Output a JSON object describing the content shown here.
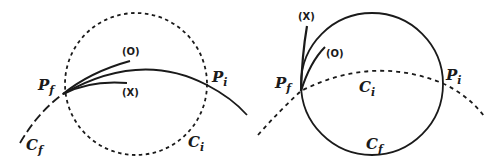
{
  "diagram": {
    "panels": [
      {
        "id": "left",
        "labels": {
          "pf": "P",
          "pf_sub": "f",
          "pi": "P",
          "pi_sub": "i",
          "cf": "C",
          "cf_sub": "f",
          "ci": "C",
          "ci_sub": "i",
          "tag_o": "(O)",
          "tag_x": "(X)"
        },
        "description": "Dashed circle C_i; solid arc C_f through P_f and P_i with two short tangent curves (O) and (X) at P_f"
      },
      {
        "id": "right",
        "labels": {
          "pf": "P",
          "pf_sub": "f",
          "pi": "P",
          "pi_sub": "i",
          "cf": "C",
          "cf_sub": "f",
          "ci": "C",
          "ci_sub": "i",
          "tag_o": "(O)",
          "tag_x": "(X)"
        },
        "description": "Solid circle C_f; dashed arc C_i through P_f and P_i with two short curves (X) and (O) at P_f"
      }
    ],
    "colors": {
      "ink": "#1a1a1a",
      "background": "#ffffff"
    }
  }
}
